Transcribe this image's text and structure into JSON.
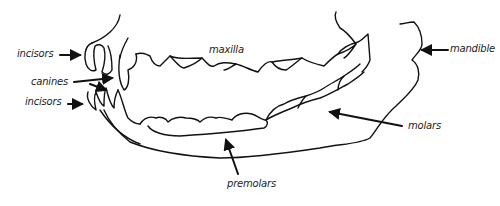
{
  "diagram": {
    "type": "anatomical-line-drawing",
    "labels": {
      "incisors_upper": "incisors",
      "canines": "canines",
      "incisors_lower": "incisors",
      "maxilla": "maxilla",
      "mandible": "mandible",
      "molars": "molars",
      "premolars": "premolars"
    },
    "colors": {
      "line": "#111111",
      "background": "#ffffff"
    }
  }
}
